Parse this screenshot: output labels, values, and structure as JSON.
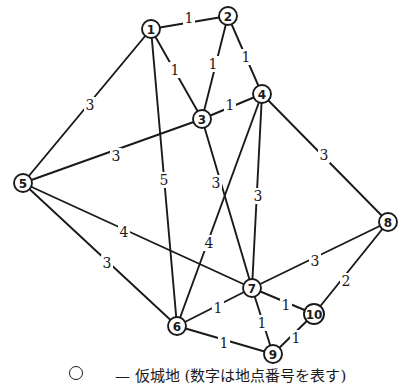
{
  "diagram": {
    "type": "weighted-undirected-graph",
    "nodes": [
      {
        "id": "1",
        "x": 151,
        "y": 29
      },
      {
        "id": "2",
        "x": 228,
        "y": 16
      },
      {
        "id": "3",
        "x": 202,
        "y": 119
      },
      {
        "id": "4",
        "x": 262,
        "y": 94
      },
      {
        "id": "5",
        "x": 23,
        "y": 183
      },
      {
        "id": "6",
        "x": 177,
        "y": 326
      },
      {
        "id": "7",
        "x": 252,
        "y": 288
      },
      {
        "id": "8",
        "x": 388,
        "y": 222
      },
      {
        "id": "9",
        "x": 273,
        "y": 354
      },
      {
        "id": "10",
        "x": 314,
        "y": 314
      }
    ],
    "edges": [
      {
        "from": "1",
        "to": "2",
        "weight": "1",
        "lx": 189,
        "ly": 18
      },
      {
        "from": "1",
        "to": "3",
        "weight": "1",
        "lx": 175,
        "ly": 70
      },
      {
        "from": "2",
        "to": "3",
        "weight": "1",
        "lx": 213,
        "ly": 64
      },
      {
        "from": "2",
        "to": "4",
        "weight": "1",
        "lx": 246,
        "ly": 57
      },
      {
        "from": "3",
        "to": "4",
        "weight": "1",
        "lx": 230,
        "ly": 105
      },
      {
        "from": "1",
        "to": "5",
        "weight": "3",
        "lx": 90,
        "ly": 105
      },
      {
        "from": "1",
        "to": "6",
        "weight": "5",
        "lx": 164,
        "ly": 180
      },
      {
        "from": "3",
        "to": "5",
        "weight": "3",
        "lx": 116,
        "ly": 156
      },
      {
        "from": "3",
        "to": "7",
        "weight": "3",
        "lx": 216,
        "ly": 183
      },
      {
        "from": "4",
        "to": "6",
        "weight": "4",
        "lx": 209,
        "ly": 243
      },
      {
        "from": "4",
        "to": "7",
        "weight": "3",
        "lx": 258,
        "ly": 196
      },
      {
        "from": "4",
        "to": "8",
        "weight": "3",
        "lx": 324,
        "ly": 155
      },
      {
        "from": "5",
        "to": "7",
        "weight": "4",
        "lx": 124,
        "ly": 232
      },
      {
        "from": "5",
        "to": "6",
        "weight": "3",
        "lx": 107,
        "ly": 263
      },
      {
        "from": "7",
        "to": "8",
        "weight": "3",
        "lx": 315,
        "ly": 261
      },
      {
        "from": "8",
        "to": "10",
        "weight": "2",
        "lx": 346,
        "ly": 281
      },
      {
        "from": "6",
        "to": "7",
        "weight": "1",
        "lx": 218,
        "ly": 308
      },
      {
        "from": "7",
        "to": "9",
        "weight": "1",
        "lx": 262,
        "ly": 323
      },
      {
        "from": "7",
        "to": "10",
        "weight": "1",
        "lx": 286,
        "ly": 305
      },
      {
        "from": "6",
        "to": "9",
        "weight": "1",
        "lx": 224,
        "ly": 343
      },
      {
        "from": "9",
        "to": "10",
        "weight": "1",
        "lx": 296,
        "ly": 338
      }
    ]
  },
  "caption": {
    "legend_symbol": "circle",
    "text": "— 仮城地 (数字は地点番号を表す)"
  },
  "colors": {
    "stroke": "#1a1a1a",
    "background": "#ffffff"
  }
}
